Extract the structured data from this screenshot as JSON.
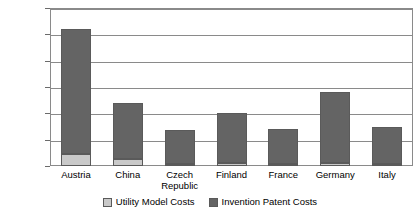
{
  "chart_data": {
    "type": "bar",
    "stacked": true,
    "title": "",
    "xlabel": "",
    "ylabel": "",
    "categories": [
      "Austria",
      "China",
      "Czech\nRepublic",
      "Finland",
      "France",
      "Germany",
      "Italy"
    ],
    "series": [
      {
        "name": "Utility Model Costs",
        "color": "#c9c9c9",
        "values": [
          2300,
          1300,
          400,
          500,
          400,
          600,
          300
        ]
      },
      {
        "name": "Invention Patent Costs",
        "color": "#646464",
        "values": [
          23700,
          10700,
          6400,
          9500,
          6600,
          13400,
          7200
        ]
      }
    ],
    "totals": [
      26000,
      12000,
      6800,
      10000,
      7000,
      14000,
      7500
    ],
    "ylim": [
      0,
      30000
    ],
    "yticks": [
      0,
      5000,
      10000,
      15000,
      20000,
      25000,
      30000
    ],
    "ytick_labels": [
      "0",
      "5,000",
      "10,000",
      "15,000",
      "20,000",
      "25,000",
      "30,000"
    ],
    "grid": true,
    "legend_position": "bottom"
  },
  "legend": {
    "items": [
      {
        "label": "Utility Model Costs",
        "color": "#c9c9c9",
        "swatch_name": "utility-model-costs-swatch"
      },
      {
        "label": "Invention Patent Costs",
        "color": "#646464",
        "swatch_name": "invention-patent-costs-swatch"
      }
    ]
  }
}
